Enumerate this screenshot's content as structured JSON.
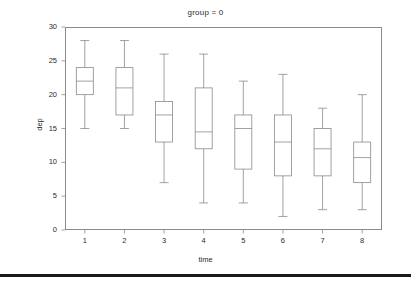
{
  "chart_data": {
    "type": "box",
    "title": "group = 0",
    "xlabel": "time",
    "ylabel": "dep",
    "categories": [
      "1",
      "2",
      "3",
      "4",
      "5",
      "6",
      "7",
      "8"
    ],
    "ylim": [
      0,
      30
    ],
    "yticks": [
      0,
      5,
      10,
      15,
      20,
      25,
      30
    ],
    "ytick_labels": [
      "0",
      "5",
      "10",
      "15",
      "20",
      "25",
      "30"
    ],
    "xtick_labels": [
      "1",
      "2",
      "3",
      "4",
      "5",
      "6",
      "7",
      "8"
    ],
    "grid": false,
    "legend": "none",
    "boxes": [
      {
        "category": "1",
        "whisker_low": 15.0,
        "q1": 20.0,
        "median": 22.0,
        "q3": 24.0,
        "whisker_high": 28.0
      },
      {
        "category": "2",
        "whisker_low": 15.0,
        "q1": 17.0,
        "median": 21.0,
        "q3": 24.0,
        "whisker_high": 28.0
      },
      {
        "category": "3",
        "whisker_low": 7.0,
        "q1": 13.0,
        "median": 17.0,
        "q3": 19.0,
        "whisker_high": 26.0
      },
      {
        "category": "4",
        "whisker_low": 4.0,
        "q1": 12.0,
        "median": 14.5,
        "q3": 21.0,
        "whisker_high": 26.0
      },
      {
        "category": "5",
        "whisker_low": 4.0,
        "q1": 9.0,
        "median": 15.0,
        "q3": 17.0,
        "whisker_high": 22.0
      },
      {
        "category": "6",
        "whisker_low": 2.0,
        "q1": 8.0,
        "median": 13.0,
        "q3": 17.0,
        "whisker_high": 23.0
      },
      {
        "category": "7",
        "whisker_low": 3.0,
        "q1": 8.0,
        "median": 12.0,
        "q3": 15.0,
        "whisker_high": 18.0
      },
      {
        "category": "8",
        "whisker_low": 3.0,
        "q1": 7.0,
        "median": 10.7,
        "q3": 13.0,
        "whisker_high": 20.0
      }
    ],
    "colors": {
      "box_stroke": "#8a8a8a",
      "frame_stroke": "#8a8a8a",
      "text": "#2b2b2b",
      "rule": "#1a1a20",
      "background": "#ffffff"
    }
  }
}
